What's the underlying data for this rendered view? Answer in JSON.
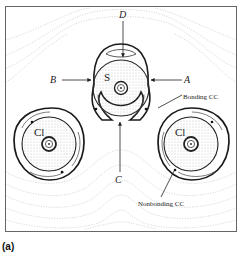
{
  "figure": {
    "panel_label": "(a)",
    "atoms": [
      {
        "symbol": "S",
        "role": "central"
      },
      {
        "symbol": "Cl",
        "role": "left"
      },
      {
        "symbol": "Cl",
        "role": "right"
      }
    ],
    "arrow_labels": {
      "A": "A",
      "B": "B",
      "C": "C",
      "D": "D"
    },
    "annotations": {
      "bonding": "Bonding CC",
      "nonbonding": "Nonbonding CC"
    },
    "colors": {
      "frame": "#555555",
      "contour": "#c8c8c8",
      "stipple": "#9a9a9a",
      "loop": "#1a1a1a",
      "background": "#ffffff"
    }
  }
}
